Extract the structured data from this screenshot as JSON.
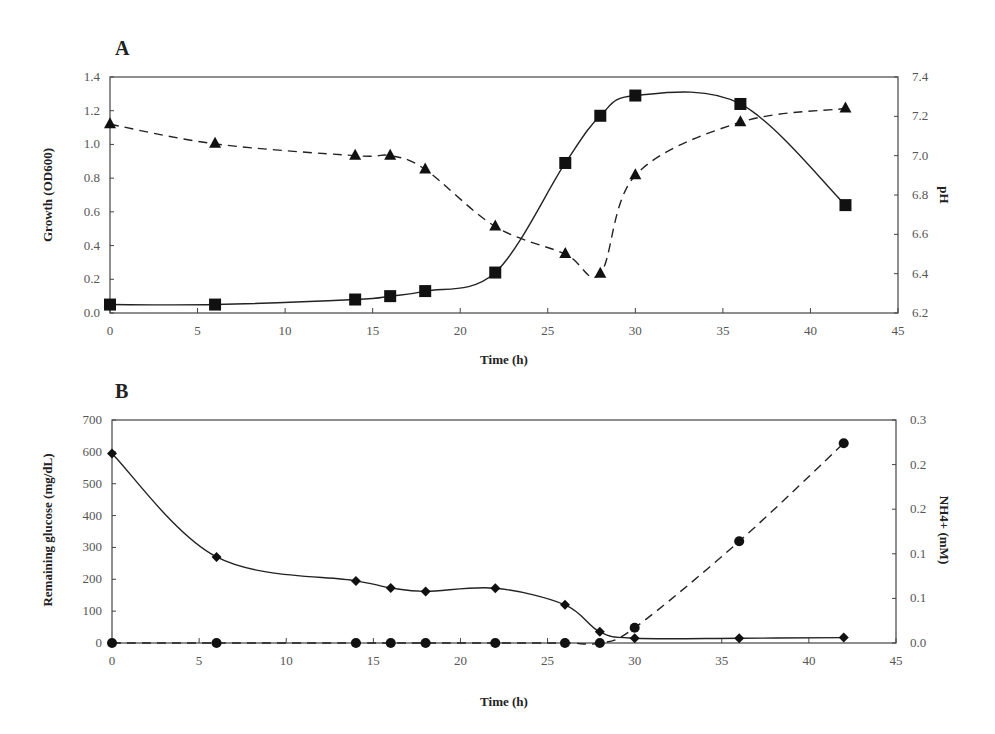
{
  "figure": {
    "panel_a_label": "A",
    "panel_b_label": "B"
  },
  "chart_data": [
    {
      "panel": "A",
      "type": "line",
      "title": "",
      "xlabel": "Time (h)",
      "ylabel": "Growth (OD600)",
      "y2label": "pH",
      "xlim": [
        0,
        45
      ],
      "ylim": [
        0.0,
        1.4
      ],
      "y2lim": [
        6.2,
        7.4
      ],
      "xticks": [
        "0",
        "5",
        "10",
        "15",
        "20",
        "25",
        "30",
        "35",
        "40",
        "45"
      ],
      "yticks": [
        "0.0",
        "0.2",
        "0.4",
        "0.6",
        "0.8",
        "1.0",
        "1.2",
        "1.4"
      ],
      "y2ticks": [
        "6.2",
        "6.4",
        "6.6",
        "6.8",
        "7.0",
        "7.2",
        "7.4"
      ],
      "grid": false,
      "series": [
        {
          "name": "Growth (OD600)",
          "axis": "left",
          "marker": "square",
          "line": "solid",
          "x": [
            0,
            6,
            14,
            16,
            18,
            22,
            26,
            28,
            30,
            36,
            42
          ],
          "values": [
            0.05,
            0.05,
            0.08,
            0.1,
            0.13,
            0.24,
            0.89,
            1.17,
            1.29,
            1.24,
            0.64
          ]
        },
        {
          "name": "pH",
          "axis": "right",
          "marker": "triangle",
          "line": "dashed",
          "x": [
            0,
            6,
            14,
            16,
            18,
            22,
            26,
            28,
            30,
            36,
            42
          ],
          "values": [
            7.16,
            7.06,
            7.0,
            7.0,
            6.93,
            6.64,
            6.5,
            6.4,
            6.9,
            7.17,
            7.24
          ]
        }
      ]
    },
    {
      "panel": "B",
      "type": "line",
      "title": "",
      "xlabel": "Time (h)",
      "ylabel": "Remaining glucose (mg/dL)",
      "y2label": "NH4+ (mM)",
      "xlim": [
        0,
        45
      ],
      "ylim": [
        0,
        700
      ],
      "y2lim": [
        0.0,
        0.25
      ],
      "xticks": [
        "0",
        "5",
        "10",
        "15",
        "20",
        "25",
        "30",
        "35",
        "40",
        "45"
      ],
      "yticks": [
        "0",
        "100",
        "200",
        "300",
        "400",
        "500",
        "600",
        "700"
      ],
      "y2ticks": [
        "0.0",
        "0.1",
        "0.1",
        "0.2",
        "0.2",
        "0.3"
      ],
      "grid": false,
      "series": [
        {
          "name": "Remaining glucose",
          "axis": "left",
          "marker": "diamond",
          "line": "solid",
          "x": [
            0,
            6,
            14,
            16,
            18,
            22,
            26,
            28,
            30,
            36,
            42
          ],
          "values": [
            595,
            270,
            195,
            173,
            162,
            172,
            120,
            35,
            15,
            15,
            17
          ]
        },
        {
          "name": "NH4+",
          "axis": "right",
          "marker": "circle",
          "line": "dashed",
          "x": [
            0,
            6,
            14,
            16,
            18,
            22,
            26,
            28,
            30,
            36,
            42
          ],
          "values": [
            0.0,
            0.0,
            0.0,
            0.0,
            0.0,
            0.0,
            0.0,
            0.0,
            0.017,
            0.114,
            0.224
          ]
        }
      ]
    }
  ]
}
